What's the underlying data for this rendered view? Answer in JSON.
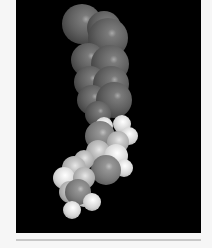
{
  "image": {
    "subject": "space-filling molecular model",
    "rendering": "grayscale",
    "background_color": "#000000",
    "border_color": "#f6f6f6",
    "rule_color": "#c8c8c8"
  },
  "atoms": [
    {
      "x": 82,
      "y": 24,
      "r": 20,
      "tone": "dark"
    },
    {
      "x": 104,
      "y": 28,
      "r": 17,
      "tone": "dark"
    },
    {
      "x": 108,
      "y": 38,
      "r": 20,
      "tone": "dark"
    },
    {
      "x": 88,
      "y": 60,
      "r": 17,
      "tone": "dark"
    },
    {
      "x": 110,
      "y": 64,
      "r": 19,
      "tone": "dark"
    },
    {
      "x": 90,
      "y": 82,
      "r": 16,
      "tone": "dark"
    },
    {
      "x": 111,
      "y": 84,
      "r": 18,
      "tone": "dark"
    },
    {
      "x": 92,
      "y": 100,
      "r": 15,
      "tone": "dark"
    },
    {
      "x": 114,
      "y": 100,
      "r": 18,
      "tone": "dark"
    },
    {
      "x": 98,
      "y": 114,
      "r": 13,
      "tone": "dark"
    },
    {
      "x": 122,
      "y": 124,
      "r": 9,
      "tone": "light"
    },
    {
      "x": 129,
      "y": 136,
      "r": 9,
      "tone": "light"
    },
    {
      "x": 104,
      "y": 126,
      "r": 9,
      "tone": "light"
    },
    {
      "x": 100,
      "y": 136,
      "r": 15,
      "tone": "mid"
    },
    {
      "x": 118,
      "y": 142,
      "r": 11,
      "tone": "pale"
    },
    {
      "x": 98,
      "y": 152,
      "r": 12,
      "tone": "pale"
    },
    {
      "x": 116,
      "y": 156,
      "r": 12,
      "tone": "light"
    },
    {
      "x": 124,
      "y": 168,
      "r": 9,
      "tone": "light"
    },
    {
      "x": 106,
      "y": 170,
      "r": 15,
      "tone": "mid"
    },
    {
      "x": 84,
      "y": 160,
      "r": 10,
      "tone": "pale"
    },
    {
      "x": 74,
      "y": 168,
      "r": 12,
      "tone": "pale"
    },
    {
      "x": 64,
      "y": 178,
      "r": 11,
      "tone": "light"
    },
    {
      "x": 84,
      "y": 178,
      "r": 11,
      "tone": "pale"
    },
    {
      "x": 70,
      "y": 192,
      "r": 11,
      "tone": "pale"
    },
    {
      "x": 84,
      "y": 198,
      "r": 9,
      "tone": "light"
    },
    {
      "x": 78,
      "y": 192,
      "r": 13,
      "tone": "mid"
    },
    {
      "x": 92,
      "y": 202,
      "r": 9,
      "tone": "light"
    },
    {
      "x": 72,
      "y": 210,
      "r": 9,
      "tone": "light"
    }
  ]
}
